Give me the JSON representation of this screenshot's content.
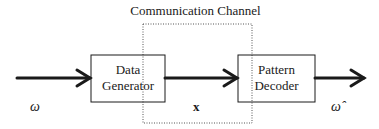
{
  "diagram": {
    "title": "Communication Channel",
    "blocks": [
      {
        "id": "data-generator",
        "line1": "Data",
        "line2": "Generator"
      },
      {
        "id": "pattern-decoder",
        "line1": "Pattern",
        "line2": "Decoder"
      }
    ],
    "labels": {
      "input": "ω",
      "signal": "x",
      "output": "ω̂"
    },
    "colors": {
      "stroke": "#1a1a1a",
      "channel_border": "#555555",
      "background": "#ffffff"
    }
  }
}
